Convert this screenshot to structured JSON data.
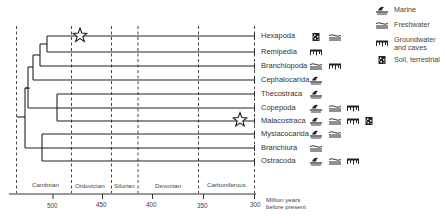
{
  "diagram": {
    "type": "phylogenetic-tree-timeline",
    "taxa": [
      {
        "name": "Hexapoda",
        "habitats": [
          "soil-terrestrial",
          "freshwater"
        ],
        "star": true
      },
      {
        "name": "Remipedia",
        "habitats": [
          "groundwater-caves"
        ]
      },
      {
        "name": "Branchiopoda",
        "habitats": [
          "freshwater",
          "groundwater-caves"
        ]
      },
      {
        "name": "Cephalocarida",
        "habitats": [
          "marine"
        ]
      },
      {
        "name": "Thecostraca",
        "habitats": [
          "marine"
        ]
      },
      {
        "name": "Copepoda",
        "habitats": [
          "marine",
          "freshwater",
          "groundwater-caves"
        ]
      },
      {
        "name": "Malacostraca",
        "habitats": [
          "marine",
          "freshwater",
          "groundwater-caves",
          "soil-terrestrial"
        ],
        "star": true
      },
      {
        "name": "Mysiacocarida",
        "habitats": [
          "marine",
          "freshwater"
        ]
      },
      {
        "name": "Branchiura",
        "habitats": [
          "freshwater"
        ]
      },
      {
        "name": "Ostracoda",
        "habitats": [
          "marine",
          "freshwater",
          "groundwater-caves"
        ]
      }
    ],
    "periods": [
      "Cambrian",
      "Ordovician",
      "Silurian",
      "Devonian",
      "Carboniferous"
    ],
    "axis": {
      "ticks": [
        "500",
        "450",
        "400",
        "350",
        "300"
      ],
      "caption_line1": "Million years",
      "caption_line2": "before present"
    },
    "legend": [
      {
        "icon": "marine-icon",
        "label": "Marine"
      },
      {
        "icon": "freshwater-icon",
        "label": "Freshwater"
      },
      {
        "icon": "groundwater-caves-icon",
        "label_line1": "Groundwater",
        "label_line2": "and caves"
      },
      {
        "icon": "soil-terrestrial-icon",
        "label": "Soil, terrestrial"
      }
    ]
  }
}
